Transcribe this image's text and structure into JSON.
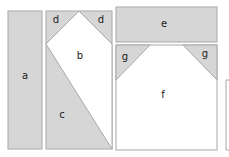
{
  "colors": {
    "shaded": "#d6d6d6",
    "stroke": "#a8a8a8",
    "blank": "#ffffff"
  },
  "labels": {
    "a": "a",
    "b": "b",
    "c": "c",
    "d_left": "d",
    "d_right": "d",
    "e": "e",
    "f": "f",
    "g_left": "g",
    "g_right": "g"
  }
}
